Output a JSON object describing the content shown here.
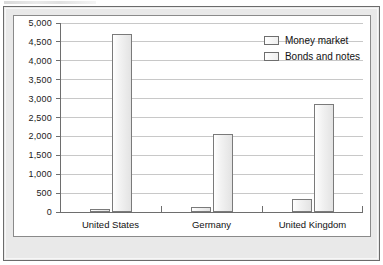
{
  "chart_data": {
    "type": "bar",
    "title": "",
    "subtitle": "",
    "xlabel": "",
    "ylabel": "",
    "categories": [
      "United States",
      "Germany",
      "United Kingdom"
    ],
    "series": [
      {
        "name": "Money market",
        "values": [
          80,
          120,
          350
        ]
      },
      {
        "name": "Bonds and notes",
        "values": [
          4700,
          2070,
          2850
        ]
      }
    ],
    "ylim": [
      0,
      5000
    ],
    "ytick_values": [
      0,
      500,
      1000,
      1500,
      2000,
      2500,
      3000,
      3500,
      4000,
      4500,
      5000
    ],
    "ytick_labels": [
      "0",
      "500",
      "1,000",
      "1,500",
      "2,000",
      "2,500",
      "3,000",
      "3,500",
      "4,000",
      "4,500",
      "5,000"
    ],
    "grid": true,
    "grid_axis": "y",
    "legend": true,
    "legend_position": "top-right",
    "legend_entries": [
      "Money market",
      "Bonds and notes"
    ],
    "bar_style": "outlined-light-gray",
    "colors": {
      "bar_fill": "#f0f0f0",
      "bar_border": "#7a7a7a",
      "gridline": "#c8c8c8",
      "axis": "#6e6e6e",
      "plot_background": "#ffffff",
      "card_background": "#e9e9e9",
      "card_border": "#6b6b6b",
      "text": "#111111"
    }
  }
}
